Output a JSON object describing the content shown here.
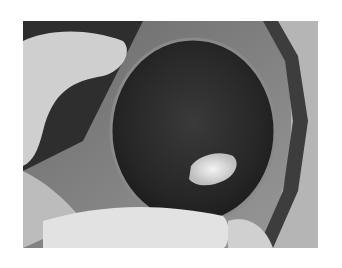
{
  "figure": {
    "top_caption_fragment": "",
    "photo": {
      "description": "Grayscale intraoperative photograph showing a large dark rounded mass with a bright white central patch, surrounded by gloved fingers, surgical drapes and gauze",
      "elements": [
        "gloved-hand-left",
        "dark-rounded-mass",
        "white-central-patch",
        "surgical-gauze-bottom",
        "tissue-edge-right"
      ]
    }
  }
}
